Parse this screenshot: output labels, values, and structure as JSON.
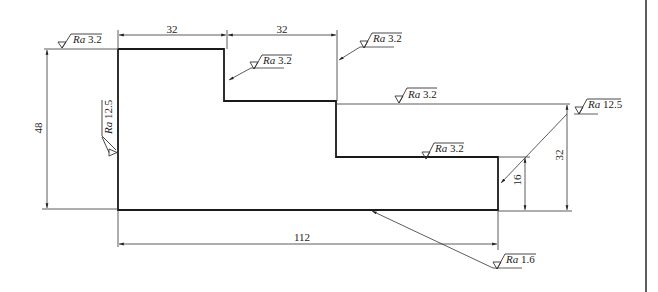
{
  "drawing": {
    "type": "engineering-part-profile",
    "border_color": "#1a1a1a",
    "dimensions": {
      "top_left_width": "32",
      "top_middle_width": "32",
      "overall_height": "48",
      "right_step_height": "32",
      "small_step_height": "16",
      "overall_length": "112"
    },
    "roughness": [
      {
        "id": "top-left-edge",
        "prefix": "Ra",
        "value": "3.2"
      },
      {
        "id": "first-step-vertical",
        "prefix": "Ra",
        "value": "3.2"
      },
      {
        "id": "second-step-vertical",
        "prefix": "Ra",
        "value": "3.2"
      },
      {
        "id": "middle-horizontal",
        "prefix": "Ra",
        "value": "3.2"
      },
      {
        "id": "right-top-corner",
        "prefix": "Ra",
        "value": "12.5"
      },
      {
        "id": "left-vertical",
        "prefix": "Ra",
        "value": "12.5"
      },
      {
        "id": "lower-horizontal",
        "prefix": "Ra",
        "value": "3.2"
      },
      {
        "id": "bottom-edge",
        "prefix": "Ra",
        "value": "1.6"
      }
    ]
  }
}
